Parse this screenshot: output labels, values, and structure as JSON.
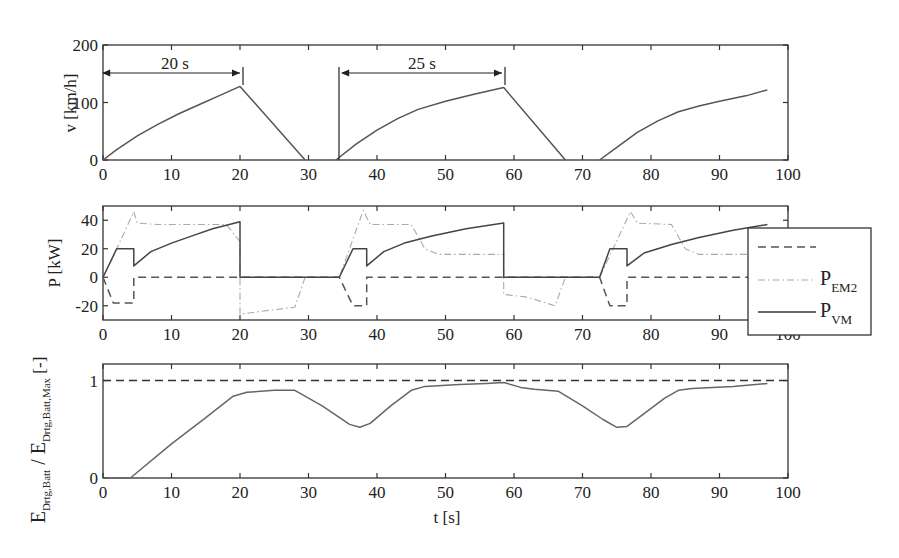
{
  "chart_data": [
    {
      "type": "line",
      "title": "",
      "xlabel": "",
      "ylabel": "v [km/h]",
      "xlim": [
        0,
        100
      ],
      "ylim": [
        0,
        200
      ],
      "xticks": [
        0,
        10,
        20,
        30,
        40,
        50,
        60,
        70,
        80,
        90,
        100
      ],
      "yticks": [
        0,
        100,
        200
      ],
      "grid": false,
      "series": [
        {
          "name": "v",
          "style": "solid",
          "color": "#555555",
          "segments": [
            [
              [
                0,
                0
              ],
              [
                2,
                18
              ],
              [
                5,
                42
              ],
              [
                8,
                62
              ],
              [
                11,
                80
              ],
              [
                14,
                96
              ],
              [
                17,
                112
              ],
              [
                20,
                128
              ],
              [
                29.5,
                0
              ]
            ],
            [
              [
                34,
                0
              ],
              [
                37,
                28
              ],
              [
                40,
                52
              ],
              [
                43,
                72
              ],
              [
                46,
                88
              ],
              [
                50,
                102
              ],
              [
                54,
                114
              ],
              [
                58.5,
                126
              ],
              [
                67.5,
                0
              ]
            ],
            [
              [
                72.5,
                0
              ],
              [
                75,
                22
              ],
              [
                78,
                48
              ],
              [
                81,
                68
              ],
              [
                84,
                84
              ],
              [
                87,
                94
              ],
              [
                90,
                102
              ],
              [
                94,
                112
              ],
              [
                97,
                122
              ]
            ]
          ]
        }
      ],
      "annotations": [
        {
          "text": "20 s",
          "from": 0,
          "to": 20,
          "y": 150
        },
        {
          "text": "25 s",
          "from": 34,
          "to": 58.5,
          "y": 150
        }
      ]
    },
    {
      "type": "line",
      "title": "",
      "xlabel": "",
      "ylabel": "P [kW]",
      "xlim": [
        0,
        100
      ],
      "ylim": [
        -30,
        50
      ],
      "xticks": [
        0,
        10,
        20,
        30,
        40,
        50,
        60,
        70,
        80,
        90,
        100
      ],
      "yticks": [
        -20,
        0,
        20,
        40
      ],
      "grid": false,
      "legend": {
        "position": "right-outside",
        "entries": [
          "",
          "P_EM2",
          "P_VM"
        ]
      },
      "series": [
        {
          "name": "",
          "style": "dashed",
          "color": "#555555",
          "points": [
            [
              0,
              0
            ],
            [
              1.5,
              -18
            ],
            [
              4.5,
              -18
            ],
            [
              4.5,
              0
            ],
            [
              20,
              0
            ],
            [
              34.5,
              0
            ],
            [
              36.5,
              -20
            ],
            [
              38.5,
              -20
            ],
            [
              38.5,
              0
            ],
            [
              58.5,
              0
            ],
            [
              72.5,
              0
            ],
            [
              74,
              -20
            ],
            [
              76.5,
              -20
            ],
            [
              76.5,
              0
            ],
            [
              97,
              0
            ]
          ]
        },
        {
          "name": "P_EM2",
          "style": "dash-dot",
          "color": "#aaaaaa",
          "points": [
            [
              0,
              0
            ],
            [
              2,
              20
            ],
            [
              4.5,
              46
            ],
            [
              5,
              38
            ],
            [
              8,
              37
            ],
            [
              18,
              37
            ],
            [
              20,
              25
            ],
            [
              20,
              -26
            ],
            [
              23,
              -24
            ],
            [
              28,
              -21
            ],
            [
              29.5,
              0
            ],
            [
              34.5,
              0
            ],
            [
              38,
              47
            ],
            [
              39,
              37
            ],
            [
              45,
              37
            ],
            [
              47,
              20
            ],
            [
              49,
              16
            ],
            [
              58.5,
              16
            ],
            [
              58.5,
              -12
            ],
            [
              62,
              -14
            ],
            [
              66,
              -20
            ],
            [
              67.5,
              0
            ],
            [
              72.5,
              0
            ],
            [
              77,
              46
            ],
            [
              78,
              38
            ],
            [
              83,
              37
            ],
            [
              85,
              20
            ],
            [
              87,
              16
            ],
            [
              97,
              16
            ]
          ]
        },
        {
          "name": "P_VM",
          "style": "solid",
          "color": "#444444",
          "points": [
            [
              0,
              0
            ],
            [
              2,
              20
            ],
            [
              4.5,
              20
            ],
            [
              4.5,
              8
            ],
            [
              7,
              18
            ],
            [
              10,
              24
            ],
            [
              13,
              29
            ],
            [
              16,
              34
            ],
            [
              20,
              39
            ],
            [
              20,
              0
            ],
            [
              34.5,
              0
            ],
            [
              36.5,
              20
            ],
            [
              38.5,
              20
            ],
            [
              38.5,
              8
            ],
            [
              41,
              18
            ],
            [
              44,
              24
            ],
            [
              48,
              29
            ],
            [
              53,
              34
            ],
            [
              58.5,
              38
            ],
            [
              58.5,
              0
            ],
            [
              72.5,
              0
            ],
            [
              74,
              20
            ],
            [
              76.5,
              20
            ],
            [
              76.5,
              8
            ],
            [
              79,
              17
            ],
            [
              83,
              23
            ],
            [
              87,
              28
            ],
            [
              92,
              33
            ],
            [
              97,
              37
            ]
          ]
        }
      ]
    },
    {
      "type": "line",
      "title": "",
      "xlabel": "t [s]",
      "ylabel": "E_Drtg,Batt / E_Drtg,Batt,Max [-]",
      "xlim": [
        0,
        100
      ],
      "ylim": [
        0,
        1.17
      ],
      "xticks": [
        0,
        10,
        20,
        30,
        40,
        50,
        60,
        70,
        80,
        90,
        100
      ],
      "yticks": [
        0,
        1
      ],
      "grid": false,
      "series": [
        {
          "name": "max",
          "style": "dashed",
          "color": "#333333",
          "points": [
            [
              0,
              1
            ],
            [
              100,
              1
            ]
          ]
        },
        {
          "name": "E ratio",
          "style": "solid",
          "color": "#666666",
          "points": [
            [
              0,
              0
            ],
            [
              4,
              0
            ],
            [
              10,
              0.35
            ],
            [
              15,
              0.62
            ],
            [
              19,
              0.84
            ],
            [
              21,
              0.88
            ],
            [
              25,
              0.9
            ],
            [
              28,
              0.9
            ],
            [
              32,
              0.74
            ],
            [
              36,
              0.55
            ],
            [
              37.5,
              0.52
            ],
            [
              39,
              0.56
            ],
            [
              42,
              0.74
            ],
            [
              45,
              0.9
            ],
            [
              47,
              0.94
            ],
            [
              52,
              0.96
            ],
            [
              56,
              0.97
            ],
            [
              58.5,
              0.98
            ],
            [
              61,
              0.93
            ],
            [
              63,
              0.91
            ],
            [
              66.5,
              0.89
            ],
            [
              70,
              0.74
            ],
            [
              73,
              0.6
            ],
            [
              75,
              0.52
            ],
            [
              76.5,
              0.53
            ],
            [
              79,
              0.66
            ],
            [
              82,
              0.82
            ],
            [
              84,
              0.9
            ],
            [
              86,
              0.92
            ],
            [
              92,
              0.94
            ],
            [
              97,
              0.97
            ]
          ]
        }
      ]
    }
  ],
  "labels": {
    "panel1_ylabel": "v [km/h]",
    "panel2_ylabel": "P [kW]",
    "panel3_ylabel_main": "E",
    "panel3_ylabel_sub1": "Drtg,Batt",
    "panel3_ylabel_sep": " / E",
    "panel3_ylabel_sub2": "Drtg,Batt,Max",
    "panel3_ylabel_unit": " [-]",
    "xlabel": "t [s]",
    "annot1": "20 s",
    "annot2": "25 s",
    "legend_em2_main": "P",
    "legend_em2_sub": "EM2",
    "legend_vm_main": "P",
    "legend_vm_sub": "VM"
  }
}
